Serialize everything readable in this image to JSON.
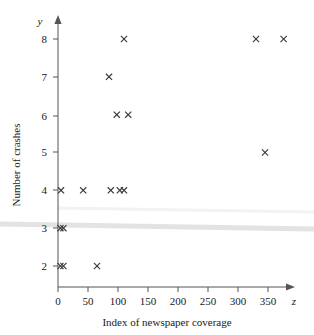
{
  "chart_data": {
    "type": "scatter",
    "title": "",
    "xlabel": "Index of newspaper coverage",
    "ylabel": "Number of crashes",
    "x_axis_variable": "z",
    "y_axis_variable": "y",
    "xlim": [
      0,
      385
    ],
    "ylim": [
      1.55,
      8.5
    ],
    "xticks": [
      0,
      50,
      100,
      150,
      200,
      250,
      300,
      350
    ],
    "xticklabels": [
      "0",
      "50",
      "100",
      "150",
      "200",
      "250",
      "300",
      "350"
    ],
    "yticks": [
      2,
      3,
      4,
      5,
      6,
      7,
      8
    ],
    "yticklabels": [
      "2",
      "3",
      "4",
      "5",
      "6",
      "7",
      "8"
    ],
    "grid": false,
    "legend": null,
    "marker": "x",
    "marker_color": "#3a3a3a",
    "points": [
      {
        "x": 4,
        "y": 2
      },
      {
        "x": 9,
        "y": 2
      },
      {
        "x": 65,
        "y": 2
      },
      {
        "x": 4,
        "y": 3
      },
      {
        "x": 9,
        "y": 3
      },
      {
        "x": 5,
        "y": 4
      },
      {
        "x": 42,
        "y": 4
      },
      {
        "x": 88,
        "y": 4
      },
      {
        "x": 103,
        "y": 4
      },
      {
        "x": 110,
        "y": 4
      },
      {
        "x": 345,
        "y": 5
      },
      {
        "x": 98,
        "y": 6
      },
      {
        "x": 117,
        "y": 6
      },
      {
        "x": 85,
        "y": 7
      },
      {
        "x": 110,
        "y": 8
      },
      {
        "x": 330,
        "y": 8
      },
      {
        "x": 376,
        "y": 8
      }
    ],
    "bands": [
      {
        "name": "upper-faint-band",
        "color": "#f2f2f2",
        "y_left": 3.82,
        "y_right": 3.7,
        "thickness": 3
      },
      {
        "name": "lower-gray-band",
        "color": "#e0e0e0",
        "y_left": 3.3,
        "y_right": 3.14,
        "thickness": 5
      }
    ]
  }
}
